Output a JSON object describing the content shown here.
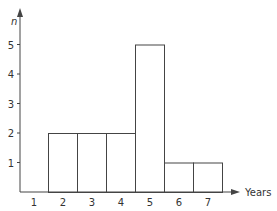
{
  "chart_data": {
    "type": "bar",
    "title": "",
    "xlabel": "Years",
    "ylabel": "n",
    "categories": [
      "1",
      "2",
      "3",
      "4",
      "5",
      "6",
      "7"
    ],
    "values": [
      0,
      2,
      2,
      2,
      5,
      1,
      1
    ],
    "yticks": [
      "1",
      "2",
      "3",
      "4",
      "5"
    ],
    "ylim": [
      0,
      5.8
    ],
    "grid": false,
    "legend": null
  }
}
